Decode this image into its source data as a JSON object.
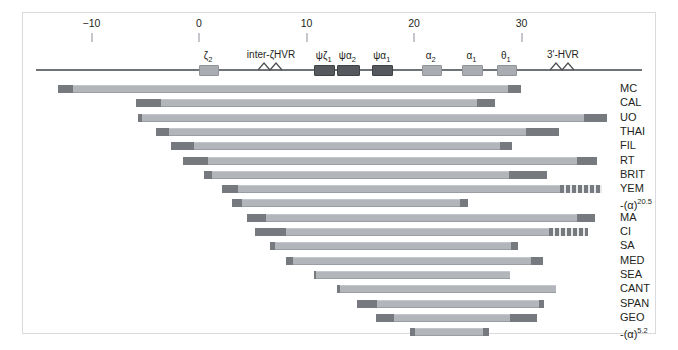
{
  "figure": {
    "axis_unit": "kb",
    "colors": {
      "frame": "#d8dadd",
      "backbone": "#6f7276",
      "bar_body": "#b2b5b9",
      "bar_cap": "#76797d",
      "gene_light": "#a9acb0",
      "gene_dark": "#55585c",
      "text": "#231f20"
    }
  },
  "chart_data": {
    "type": "bar",
    "title": "",
    "xlabel": "",
    "ylabel": "",
    "xlim": [
      -14,
      38
    ],
    "grid": false,
    "legend": "none",
    "axis": {
      "tick_values": [
        -10,
        0,
        10,
        20,
        30
      ],
      "tick_labels": [
        "−10",
        "0",
        "10",
        "20",
        "30"
      ],
      "pixels_per_unit": 10.75,
      "origin_px": 199
    },
    "genes": [
      {
        "name": "ζ2",
        "label_main": "ζ",
        "label_sub": "2",
        "start": 0.0,
        "end": 1.7,
        "shade": "light"
      },
      {
        "name": "inter-ζHVR",
        "label_main": "inter-ζHVR",
        "label_sub": "",
        "start": 6.0,
        "end": 7.4,
        "shade": "hvr"
      },
      {
        "name": "ψζ1",
        "label_main": "ψζ",
        "label_sub": "1",
        "start": 10.7,
        "end": 12.5,
        "shade": "dark"
      },
      {
        "name": "ψα2",
        "label_main": "ψα",
        "label_sub": "2",
        "start": 12.8,
        "end": 14.8,
        "shade": "dark"
      },
      {
        "name": "ψα1",
        "label_main": "ψα",
        "label_sub": "1",
        "start": 16.1,
        "end": 17.9,
        "shade": "dark"
      },
      {
        "name": "α2",
        "label_main": "α",
        "label_sub": "2",
        "start": 20.7,
        "end": 22.4,
        "shade": "light"
      },
      {
        "name": "α1",
        "label_main": "α",
        "label_sub": "1",
        "start": 24.5,
        "end": 26.2,
        "shade": "light"
      },
      {
        "name": "θ1",
        "label_main": "θ",
        "label_sub": "1",
        "start": 27.7,
        "end": 29.4,
        "shade": "light"
      },
      {
        "name": "3'-HVR",
        "label_main": "3'-HVR",
        "label_sub": "",
        "start": 33.1,
        "end": 34.6,
        "shade": "hvr"
      }
    ],
    "categories": [
      "MC",
      "CAL",
      "UO",
      "THAI",
      "FIL",
      "RT",
      "BRIT",
      "YEM",
      "-(α)20.5",
      "MA",
      "CI",
      "SA",
      "MED",
      "SEA",
      "CANT",
      "SPAN",
      "GEO",
      "-(α)5.2"
    ],
    "series": [
      {
        "name": "deletion extent (kb)",
        "rows": [
          {
            "label": "MC",
            "label_base": "MC",
            "label_sup": "",
            "start": -13.1,
            "end": 30.0,
            "left_cap_end": -11.7,
            "right_cap_start": 28.7,
            "right_cap_style": "solid"
          },
          {
            "label": "CAL",
            "label_base": "CAL",
            "label_sup": "",
            "start": -5.9,
            "end": 27.5,
            "left_cap_end": -3.5,
            "right_cap_start": 25.9,
            "right_cap_style": "solid"
          },
          {
            "label": "UO",
            "label_base": "UO",
            "label_sup": "",
            "start": -5.7,
            "end": 38.0,
            "left_cap_end": -5.3,
            "right_cap_start": 35.8,
            "right_cap_style": "solid"
          },
          {
            "label": "THAI",
            "label_base": "THAI",
            "label_sup": "",
            "start": -4.0,
            "end": 33.5,
            "left_cap_end": -2.8,
            "right_cap_start": 30.4,
            "right_cap_style": "solid"
          },
          {
            "label": "FIL",
            "label_base": "FIL",
            "label_sup": "",
            "start": -2.6,
            "end": 29.1,
            "left_cap_end": -0.5,
            "right_cap_start": 28.0,
            "right_cap_style": "solid"
          },
          {
            "label": "RT",
            "label_base": "RT",
            "label_sup": "",
            "start": -1.5,
            "end": 37.0,
            "left_cap_end": 0.8,
            "right_cap_start": 35.2,
            "right_cap_style": "solid"
          },
          {
            "label": "BRIT",
            "label_base": "BRIT",
            "label_sup": "",
            "start": 0.5,
            "end": 32.4,
            "left_cap_end": 1.2,
            "right_cap_start": 28.8,
            "right_cap_style": "solid"
          },
          {
            "label": "YEM",
            "label_base": "YEM",
            "label_sup": "",
            "start": 2.1,
            "end": 37.5,
            "left_cap_end": 3.6,
            "right_cap_start": 33.6,
            "right_cap_style": "hatched"
          },
          {
            "label": "-(α)20.5",
            "label_base": "-(α)",
            "label_sup": "20.5",
            "start": 3.1,
            "end": 25.0,
            "left_cap_end": 4.0,
            "right_cap_start": 24.3,
            "right_cap_style": "solid"
          },
          {
            "label": "MA",
            "label_base": "MA",
            "label_sup": "",
            "start": 4.5,
            "end": 36.8,
            "left_cap_end": 6.2,
            "right_cap_start": 35.2,
            "right_cap_style": "solid"
          },
          {
            "label": "CI",
            "label_base": "CI",
            "label_sup": "",
            "start": 5.2,
            "end": 36.2,
            "left_cap_end": 8.1,
            "right_cap_start": 32.6,
            "right_cap_style": "hatched"
          },
          {
            "label": "SA",
            "label_base": "SA",
            "label_sup": "",
            "start": 6.6,
            "end": 29.7,
            "left_cap_end": 7.1,
            "right_cap_start": 29.0,
            "right_cap_style": "solid"
          },
          {
            "label": "MED",
            "label_base": "MED",
            "label_sup": "",
            "start": 8.1,
            "end": 32.0,
            "left_cap_end": 8.7,
            "right_cap_start": 30.9,
            "right_cap_style": "solid"
          },
          {
            "label": "SEA",
            "label_base": "SEA",
            "label_sup": "",
            "start": 10.7,
            "end": 28.9,
            "left_cap_end": 10.9,
            "right_cap_start": 28.9,
            "right_cap_style": "none"
          },
          {
            "label": "CANT",
            "label_base": "CANT",
            "label_sup": "",
            "start": 12.8,
            "end": 33.2,
            "left_cap_end": 13.1,
            "right_cap_start": 33.2,
            "right_cap_style": "none"
          },
          {
            "label": "SPAN",
            "label_base": "SPAN",
            "label_sup": "",
            "start": 14.7,
            "end": 32.1,
            "left_cap_end": 16.6,
            "right_cap_start": 31.6,
            "right_cap_style": "solid"
          },
          {
            "label": "GEO",
            "label_base": "GEO",
            "label_sup": "",
            "start": 16.5,
            "end": 31.4,
            "left_cap_end": 18.1,
            "right_cap_start": 28.9,
            "right_cap_style": "solid"
          },
          {
            "label": "-(α)5.2",
            "label_base": "-(α)",
            "label_sup": "5.2",
            "start": 19.6,
            "end": 27.0,
            "left_cap_end": 20.1,
            "right_cap_start": 26.4,
            "right_cap_style": "solid"
          }
        ]
      }
    ]
  }
}
